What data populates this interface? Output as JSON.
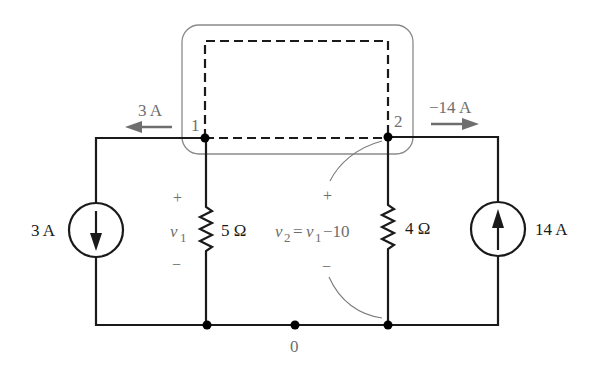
{
  "diagram": {
    "type": "circuit",
    "nodes": {
      "n1": {
        "label": "1"
      },
      "n2": {
        "label": "2"
      },
      "ground": {
        "label": "0"
      }
    },
    "branch_currents": {
      "left": {
        "label": "3 A",
        "direction": "left"
      },
      "right": {
        "label": "−14 A",
        "direction": "right"
      }
    },
    "sources": {
      "left": {
        "label": "3 A",
        "arrow": "down"
      },
      "right": {
        "label": "14 A",
        "arrow": "up"
      }
    },
    "resistors": {
      "r1": {
        "label": "5 Ω"
      },
      "r2": {
        "label": "4 Ω"
      }
    },
    "voltages": {
      "v1": {
        "symbol": "v",
        "subscript": "1",
        "plus": "+",
        "minus": "−"
      },
      "v2": {
        "symbol": "v",
        "subscript": "2",
        "equals": "=",
        "rhs_symbol": "v",
        "rhs_subscript": "1",
        "rhs_tail": "−10",
        "plus": "+",
        "minus": "−"
      }
    },
    "colors": {
      "wire": "#1a1a1a",
      "annotation": "#6e6e6e",
      "supernode_outline": "#8a8a8a"
    }
  }
}
